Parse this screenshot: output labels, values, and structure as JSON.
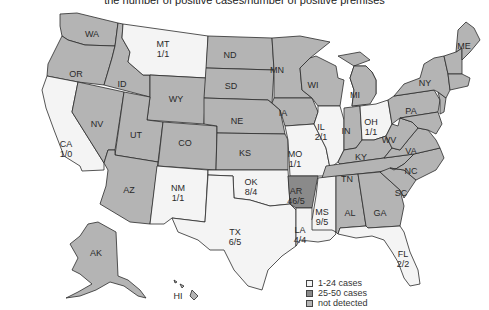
{
  "title": "the number of positive cases/number of positive premises",
  "colors": {
    "low": "#f4f4f4",
    "high": "#8a8a8a",
    "none": "#b4b4b4",
    "border": "#2b2b2b"
  },
  "legend": [
    {
      "label": "1-24 cases",
      "category": "low"
    },
    {
      "label": "25-50 cases",
      "category": "high"
    },
    {
      "label": "not detected",
      "category": "none"
    }
  ],
  "states": {
    "WA": {
      "abbr": "WA",
      "value": "",
      "category": "none"
    },
    "OR": {
      "abbr": "OR",
      "value": "",
      "category": "none"
    },
    "CA": {
      "abbr": "CA",
      "value": "1/0",
      "category": "low"
    },
    "ID": {
      "abbr": "ID",
      "value": "",
      "category": "none"
    },
    "NV": {
      "abbr": "NV",
      "value": "",
      "category": "none"
    },
    "MT": {
      "abbr": "MT",
      "value": "1/1",
      "category": "low"
    },
    "WY": {
      "abbr": "WY",
      "value": "",
      "category": "none"
    },
    "UT": {
      "abbr": "UT",
      "value": "",
      "category": "none"
    },
    "AZ": {
      "abbr": "AZ",
      "value": "",
      "category": "none"
    },
    "CO": {
      "abbr": "CO",
      "value": "",
      "category": "none"
    },
    "NM": {
      "abbr": "NM",
      "value": "1/1",
      "category": "low"
    },
    "ND": {
      "abbr": "ND",
      "value": "",
      "category": "none"
    },
    "SD": {
      "abbr": "SD",
      "value": "",
      "category": "none"
    },
    "NE": {
      "abbr": "NE",
      "value": "",
      "category": "none"
    },
    "KS": {
      "abbr": "KS",
      "value": "",
      "category": "none"
    },
    "OK": {
      "abbr": "OK",
      "value": "8/4",
      "category": "low"
    },
    "TX": {
      "abbr": "TX",
      "value": "6/5",
      "category": "low"
    },
    "MN": {
      "abbr": "MN",
      "value": "",
      "category": "none"
    },
    "IA": {
      "abbr": "IA",
      "value": "",
      "category": "none"
    },
    "MO": {
      "abbr": "MO",
      "value": "1/1",
      "category": "low"
    },
    "AR": {
      "abbr": "AR",
      "value": "46/5",
      "category": "high"
    },
    "LA": {
      "abbr": "LA",
      "value": "4/4",
      "category": "low"
    },
    "WI": {
      "abbr": "WI",
      "value": "",
      "category": "none"
    },
    "IL": {
      "abbr": "IL",
      "value": "2/1",
      "category": "low"
    },
    "MI": {
      "abbr": "MI",
      "value": "",
      "category": "none"
    },
    "IN": {
      "abbr": "IN",
      "value": "",
      "category": "none"
    },
    "OH": {
      "abbr": "OH",
      "value": "1/1",
      "category": "low"
    },
    "KY": {
      "abbr": "KY",
      "value": "",
      "category": "none"
    },
    "TN": {
      "abbr": "TN",
      "value": "",
      "category": "none"
    },
    "MS": {
      "abbr": "MS",
      "value": "9/5",
      "category": "low"
    },
    "AL": {
      "abbr": "AL",
      "value": "",
      "category": "none"
    },
    "GA": {
      "abbr": "GA",
      "value": "",
      "category": "none"
    },
    "FL": {
      "abbr": "FL",
      "value": "2/2",
      "category": "low"
    },
    "SC": {
      "abbr": "SC",
      "value": "",
      "category": "none"
    },
    "NC": {
      "abbr": "NC",
      "value": "",
      "category": "none"
    },
    "VA": {
      "abbr": "VA",
      "value": "",
      "category": "none"
    },
    "WV": {
      "abbr": "WV",
      "value": "",
      "category": "none"
    },
    "PA": {
      "abbr": "PA",
      "value": "",
      "category": "none"
    },
    "NY": {
      "abbr": "NY",
      "value": "",
      "category": "none"
    },
    "ME": {
      "abbr": "ME",
      "value": "",
      "category": "none"
    },
    "AK": {
      "abbr": "AK",
      "value": "",
      "category": "none"
    },
    "HI": {
      "abbr": "HI",
      "value": "",
      "category": "none"
    }
  }
}
